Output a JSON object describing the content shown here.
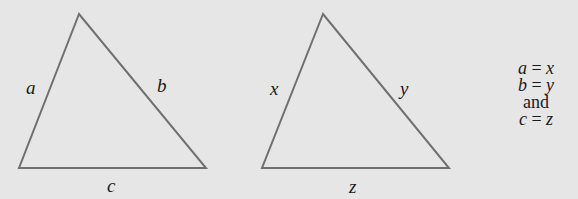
{
  "figure": {
    "background": "#e6e6e6",
    "stroke_color": "#707070",
    "triangles": [
      {
        "name": "triangle-abc",
        "vertices": [
          [
            79,
            14
          ],
          [
            19,
            168
          ],
          [
            206,
            168
          ]
        ],
        "sides": {
          "left": "a",
          "right": "b",
          "bottom": "c"
        }
      },
      {
        "name": "triangle-xyz",
        "vertices": [
          [
            323,
            14
          ],
          [
            262,
            168
          ],
          [
            449,
            168
          ]
        ],
        "sides": {
          "left": "x",
          "right": "y",
          "bottom": "z"
        }
      }
    ],
    "conditions": {
      "line1": {
        "lhs": "a",
        "op": "=",
        "rhs": "x"
      },
      "line2": {
        "lhs": "b",
        "op": "=",
        "rhs": "y"
      },
      "connector": "and",
      "line3": {
        "lhs": "c",
        "op": "=",
        "rhs": "z"
      }
    }
  }
}
